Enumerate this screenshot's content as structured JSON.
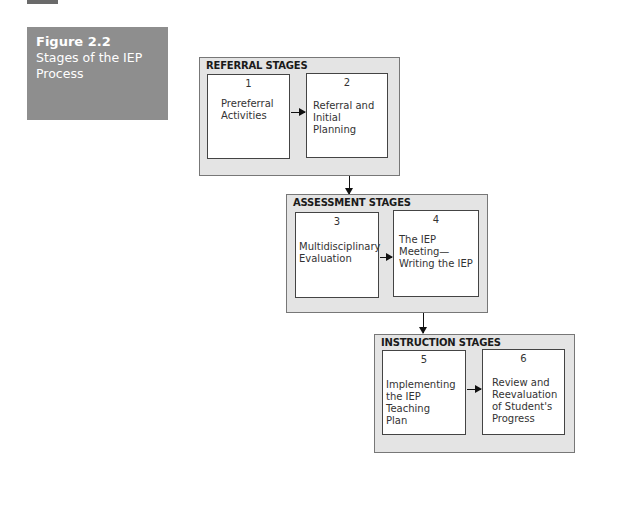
{
  "figure": {
    "number": "Figure 2.2",
    "title_line1": "Stages of the IEP",
    "title_line2": "Process"
  },
  "groups": [
    {
      "title": "REFERRAL STAGES",
      "stages": [
        {
          "number": "1",
          "lines": [
            "Prereferral",
            "Activities"
          ]
        },
        {
          "number": "2",
          "lines": [
            "Referral and",
            "Initial Planning"
          ]
        }
      ]
    },
    {
      "title": "ASSESSMENT STAGES",
      "stages": [
        {
          "number": "3",
          "lines": [
            "Multidisciplinary",
            "Evaluation"
          ]
        },
        {
          "number": "4",
          "lines": [
            "The IEP",
            "Meeting—",
            "Writing the IEP"
          ]
        }
      ]
    },
    {
      "title": "INSTRUCTION STAGES",
      "stages": [
        {
          "number": "5",
          "lines": [
            "Implementing",
            "the IEP Teaching",
            "Plan"
          ]
        },
        {
          "number": "6",
          "lines": [
            "Review and",
            "Reevaluation",
            "of Student's",
            "Progress"
          ]
        }
      ]
    }
  ]
}
